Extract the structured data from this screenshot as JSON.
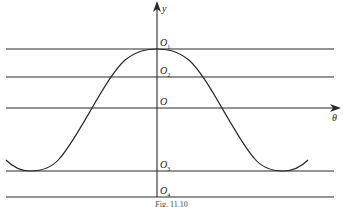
{
  "figure": {
    "caption": "Fig. 11.10",
    "axes": {
      "vertical_label": "y",
      "horizontal_label": "θ"
    },
    "levels": [
      {
        "name": "O1",
        "letter": "O",
        "sub": "1"
      },
      {
        "name": "O2",
        "letter": "O",
        "sub": "2"
      },
      {
        "name": "O",
        "letter": "O",
        "sub": ""
      },
      {
        "name": "O3",
        "letter": "O",
        "sub": "3"
      },
      {
        "name": "O4",
        "letter": "O",
        "sub": "4"
      }
    ],
    "curve": {
      "description": "cosine-like curve peaking at O1 on the y axis, with minima touching the O3 line at both sides",
      "color": "#2a2a2a"
    },
    "line_color": "#2a2a2a"
  }
}
